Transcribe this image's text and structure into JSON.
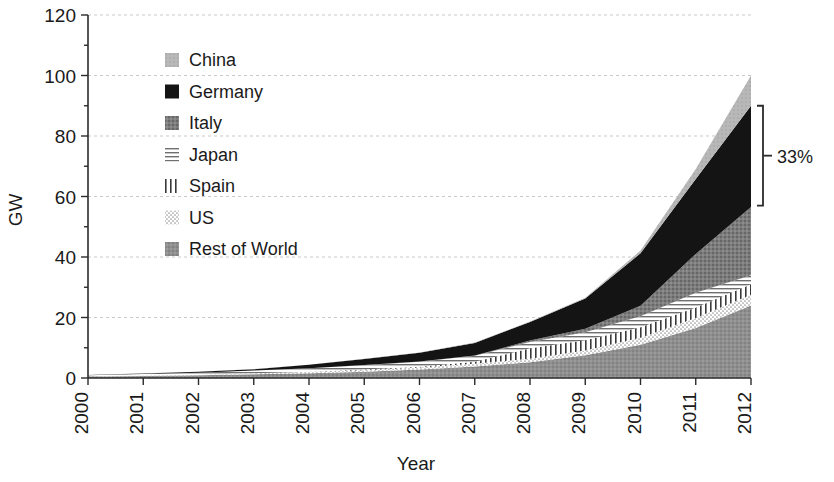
{
  "chart_data": {
    "type": "area",
    "stacked": true,
    "title": "",
    "xlabel": "Year",
    "ylabel": "GW",
    "x": [
      2000,
      2001,
      2002,
      2003,
      2004,
      2005,
      2006,
      2007,
      2008,
      2009,
      2010,
      2011,
      2012
    ],
    "categories": [
      "2000",
      "2001",
      "2002",
      "2003",
      "2004",
      "2005",
      "2006",
      "2007",
      "2008",
      "2009",
      "2010",
      "2011",
      "2012"
    ],
    "xlim": [
      2000,
      2012
    ],
    "ylim": [
      0,
      120
    ],
    "yticks": [
      0,
      20,
      40,
      60,
      80,
      100,
      120
    ],
    "ytick_labels": [
      "0",
      "20",
      "40",
      "60",
      "80",
      "100",
      "120"
    ],
    "grid": true,
    "legend_position": "inside-top-left",
    "stack_order_bottom_to_top": [
      "Rest of World",
      "US",
      "Spain",
      "Japan",
      "Italy",
      "Germany",
      "China"
    ],
    "series": [
      {
        "name": "Rest of World",
        "pattern": "solid-medium-gray",
        "color": "#8c8c8c",
        "values": [
          0.5,
          0.7,
          0.9,
          1.2,
          1.6,
          2.1,
          2.8,
          3.8,
          5.2,
          7.5,
          11.0,
          16.5,
          24.0
        ]
      },
      {
        "name": "US",
        "pattern": "fine-dots",
        "color": "#d8d8d8",
        "values": [
          0.1,
          0.15,
          0.2,
          0.3,
          0.4,
          0.5,
          0.7,
          0.9,
          1.2,
          1.6,
          2.3,
          3.3,
          3.5
        ]
      },
      {
        "name": "Spain",
        "pattern": "vertical-lines",
        "color": "#ffffff",
        "values": [
          0.0,
          0.0,
          0.0,
          0.1,
          0.1,
          0.2,
          0.2,
          0.7,
          3.4,
          3.4,
          3.5,
          3.5,
          3.5
        ]
      },
      {
        "name": "Japan",
        "pattern": "horizontal-lines",
        "color": "#cfcfcf",
        "values": [
          0.3,
          0.45,
          0.64,
          0.86,
          1.13,
          1.42,
          1.71,
          1.92,
          2.14,
          2.63,
          3.62,
          4.91,
          3.0
        ]
      },
      {
        "name": "Italy",
        "pattern": "textured-dark-gray",
        "color": "#7a7a7a",
        "values": [
          0.02,
          0.02,
          0.02,
          0.03,
          0.03,
          0.04,
          0.05,
          0.12,
          0.46,
          1.18,
          3.5,
          12.8,
          22.5
        ]
      },
      {
        "name": "Germany",
        "pattern": "solid-black",
        "color": "#141414",
        "values": [
          0.08,
          0.18,
          0.3,
          0.43,
          1.1,
          2.06,
          2.9,
          4.17,
          6.12,
          9.96,
          17.3,
          24.8,
          33.5
        ]
      },
      {
        "name": "China",
        "pattern": "solid-light-gray",
        "color": "#b5b5b5",
        "values": [
          0.02,
          0.03,
          0.04,
          0.05,
          0.06,
          0.07,
          0.08,
          0.1,
          0.14,
          0.3,
          0.9,
          3.3,
          10.0
        ]
      }
    ],
    "cumulative_2012_boundaries": [
      24.0,
      27.5,
      31.0,
      34.0,
      56.5,
      90.0,
      100.0
    ],
    "annotations": [
      {
        "name": "germany-share-bracket",
        "label": "33%",
        "span_start": 57,
        "span_end": 90,
        "at_x": 2012
      }
    ]
  },
  "legend": {
    "items": [
      {
        "label": "China",
        "swatch": "china-swatch"
      },
      {
        "label": "Germany",
        "swatch": "germany-swatch"
      },
      {
        "label": "Italy",
        "swatch": "italy-swatch"
      },
      {
        "label": "Japan",
        "swatch": "japan-swatch"
      },
      {
        "label": "Spain",
        "swatch": "spain-swatch"
      },
      {
        "label": "US",
        "swatch": "us-swatch"
      },
      {
        "label": "Rest of World",
        "swatch": "rest-of-world-swatch"
      }
    ]
  },
  "axes": {
    "y_title": "GW",
    "x_title": "Year"
  },
  "colors": {
    "china": "#b5b5b5",
    "germany": "#141414",
    "italy": "#7a7a7a",
    "japan": "#cfcfcf",
    "spain": "#ffffff",
    "us": "#e2e2e2",
    "rest_of_world": "#8c8c8c",
    "grid": "#c9c9c9",
    "axis": "#2b2b2b",
    "text": "#1a1a1a"
  }
}
